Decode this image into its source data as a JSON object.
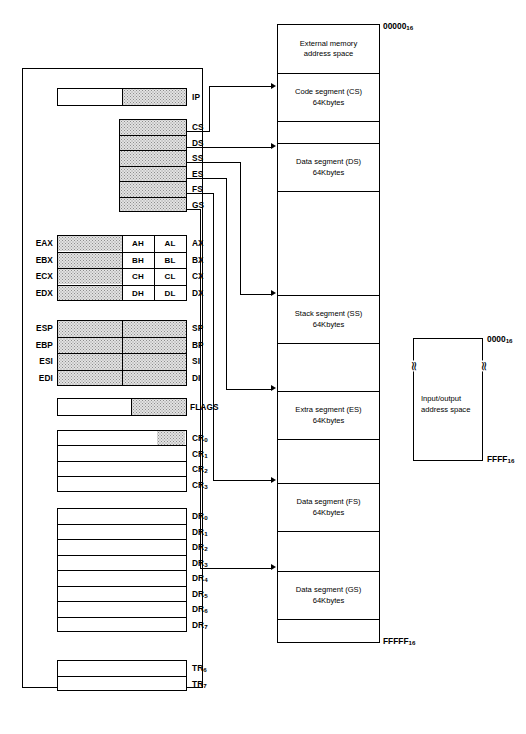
{
  "diagram": {
    "instruction_pointer": {
      "label": "IP",
      "upper_label": "",
      "shaded_half": "lower"
    },
    "segment_registers": [
      {
        "label": "CS",
        "target": "code-segment"
      },
      {
        "label": "DS",
        "target": "data-segment-ds"
      },
      {
        "label": "SS",
        "target": "stack-segment"
      },
      {
        "label": "ES",
        "target": "extra-segment"
      },
      {
        "label": "FS",
        "target": "data-segment-fs"
      },
      {
        "label": "GS",
        "target": "data-segment-gs"
      }
    ],
    "general_registers": [
      {
        "ext": "EAX",
        "high": "AH",
        "low": "AL",
        "word": "AX"
      },
      {
        "ext": "EBX",
        "high": "BH",
        "low": "BL",
        "word": "BX"
      },
      {
        "ext": "ECX",
        "high": "CH",
        "low": "CL",
        "word": "CX"
      },
      {
        "ext": "EDX",
        "high": "DH",
        "low": "DL",
        "word": "DX"
      }
    ],
    "pointer_index_registers": [
      {
        "ext": "ESP",
        "word": "SP"
      },
      {
        "ext": "EBP",
        "word": "BP"
      },
      {
        "ext": "ESI",
        "word": "SI"
      },
      {
        "ext": "EDI",
        "word": "DI"
      }
    ],
    "flags_register": {
      "label": "FLAGS"
    },
    "control_registers": [
      {
        "label": "CR",
        "index": "0"
      },
      {
        "label": "CR",
        "index": "1"
      },
      {
        "label": "CR",
        "index": "2"
      },
      {
        "label": "CR",
        "index": "3"
      }
    ],
    "debug_registers": [
      {
        "label": "DR",
        "index": "0"
      },
      {
        "label": "DR",
        "index": "1"
      },
      {
        "label": "DR",
        "index": "2"
      },
      {
        "label": "DR",
        "index": "3"
      },
      {
        "label": "DR",
        "index": "4"
      },
      {
        "label": "DR",
        "index": "5"
      },
      {
        "label": "DR",
        "index": "6"
      },
      {
        "label": "DR",
        "index": "7"
      }
    ],
    "test_registers": [
      {
        "label": "TR",
        "index": "6"
      },
      {
        "label": "TR",
        "index": "7"
      }
    ],
    "memory_space": {
      "top_address": "00000",
      "top_address_sub": "16",
      "bottom_address": "FFFFF",
      "bottom_address_sub": "16",
      "segments": [
        {
          "name": "external-memory",
          "text": "External memory\naddress space",
          "labeled": true
        },
        {
          "name": "code-segment",
          "text": "Code segment (CS)\n64Kbytes",
          "labeled": true
        },
        {
          "name": "gap-1",
          "text": "",
          "labeled": false
        },
        {
          "name": "data-segment-ds",
          "text": "Data segment (DS)\n64Kbytes",
          "labeled": true
        },
        {
          "name": "gap-2",
          "text": "",
          "labeled": false
        },
        {
          "name": "stack-segment",
          "text": "Stack segment (SS)\n64Kbytes",
          "labeled": true
        },
        {
          "name": "gap-3",
          "text": "",
          "labeled": false
        },
        {
          "name": "extra-segment",
          "text": "Extra segment (ES)\n64Kbytes",
          "labeled": true
        },
        {
          "name": "gap-4",
          "text": "",
          "labeled": false
        },
        {
          "name": "data-segment-fs",
          "text": "Data segment (FS)\n64Kbytes",
          "labeled": true
        },
        {
          "name": "gap-5",
          "text": "",
          "labeled": false
        },
        {
          "name": "data-segment-gs",
          "text": "Data segment (GS)\n64Kbytes",
          "labeled": true
        },
        {
          "name": "gap-6",
          "text": "",
          "labeled": false
        }
      ]
    },
    "io_space": {
      "text": "Input/output\naddress space",
      "top_address": "0000",
      "top_address_sub": "16",
      "bottom_address": "FFFF",
      "bottom_address_sub": "16",
      "break_mark": "≈"
    }
  }
}
